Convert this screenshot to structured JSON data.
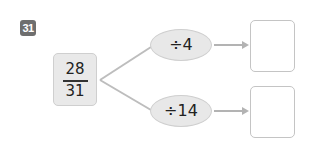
{
  "problem": {
    "number": "31",
    "fraction": {
      "numerator": "28",
      "denominator": "31"
    },
    "operations": [
      {
        "label": "÷4",
        "answer": ""
      },
      {
        "label": "÷14",
        "answer": ""
      }
    ]
  }
}
